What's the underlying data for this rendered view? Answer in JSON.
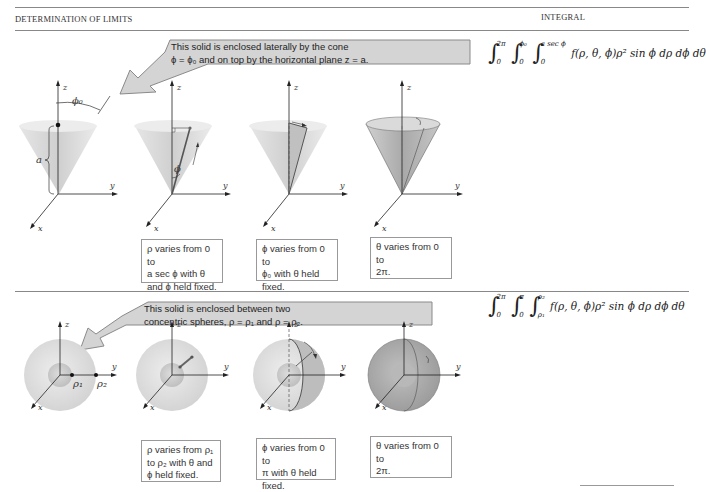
{
  "header": {
    "left": "DETERMINATION OF LIMITS",
    "right": "INTEGRAL"
  },
  "sections": [
    {
      "callout": {
        "line1": "This solid is enclosed laterally by the cone",
        "line2": "ϕ = ϕ₀ and on top by the horizontal plane z = a."
      },
      "integral": {
        "l1_upper": "2π",
        "l1_lower": "0",
        "l2_upper": "ϕ₀",
        "l2_lower": "0",
        "l3_upper": "a sec ϕ",
        "l3_lower": "0",
        "integrand": "f(ρ, θ, ϕ)ρ² sin ϕ dρ dϕ dθ"
      },
      "figure_labels": {
        "phi0": "ϕ₀",
        "a": "a",
        "phi": "ϕ",
        "x": "x",
        "y": "y",
        "z": "z"
      },
      "descriptions": [
        {
          "lines": [
            "ρ varies from 0 to",
            "a sec ϕ with θ",
            "and ϕ held fixed."
          ]
        },
        {
          "lines": [
            "ϕ varies from 0 to",
            "ϕ₀ with θ held",
            "fixed."
          ]
        },
        {
          "lines": [
            "θ varies from 0 to",
            "2π."
          ]
        }
      ]
    },
    {
      "callout": {
        "line1": "This solid is enclosed between two",
        "line2": "concentric spheres, ρ = ρ₁ and ρ = ρ₂."
      },
      "integral": {
        "l1_upper": "2π",
        "l1_lower": "0",
        "l2_upper": "π",
        "l2_lower": "0",
        "l3_upper": "ρ₂",
        "l3_lower": "ρ₁",
        "integrand": "f(ρ, θ, ϕ)ρ² sin ϕ dρ dϕ dθ"
      },
      "figure_labels": {
        "rho1": "ρ₁",
        "rho2": "ρ₂",
        "x": "x",
        "y": "y",
        "z": "z"
      },
      "descriptions": [
        {
          "lines": [
            "ρ varies from ρ₁",
            "to ρ₂ with θ and",
            "ϕ held fixed."
          ]
        },
        {
          "lines": [
            "ϕ varies from 0 to",
            "π with θ held",
            "fixed."
          ]
        },
        {
          "lines": [
            "θ varies from 0 to",
            "2π."
          ]
        }
      ]
    }
  ],
  "colors": {
    "callout_fill": "#d4d4d4",
    "callout_stroke": "#8a8a8a",
    "cone_fill": "#d8d8d8",
    "sphere_fill": "#e2e2e2",
    "sphere_dark": "#a8a8a8",
    "rule": "#888888"
  }
}
